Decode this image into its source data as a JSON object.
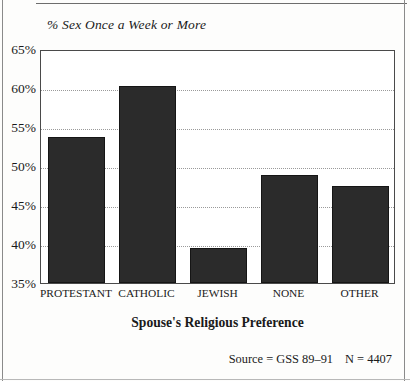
{
  "chart_title": "% Sex Once a Week or More",
  "axis_title": "Spouse's Religious Preference",
  "source_note": {
    "source": "Source = GSS 89–91",
    "n": "N = 4407"
  },
  "y_axis": {
    "ticks": [
      "65%",
      "60%",
      "55%",
      "50%",
      "45%",
      "40%",
      "35%"
    ]
  },
  "colors": {
    "bar_fill": "#2b2b2b",
    "frame": "#4a4a4a",
    "gridline": "#9a9a9a",
    "background": "#fdfdfc"
  },
  "chart_data": {
    "type": "bar",
    "title": "% Sex Once a Week or More",
    "xlabel": "Spouse's Religious Preference",
    "ylabel": "",
    "ylim": [
      35,
      65
    ],
    "ytick_step": 5,
    "ytick_format": "percent",
    "grid": true,
    "legend": "none",
    "categories": [
      "PROTESTANT",
      "CATHOLIC",
      "JEWISH",
      "NONE",
      "OTHER"
    ],
    "values": [
      53.7,
      60.2,
      39.5,
      48.8,
      47.5
    ],
    "annotations": [
      "Source = GSS 89–91",
      "N = 4407"
    ]
  }
}
